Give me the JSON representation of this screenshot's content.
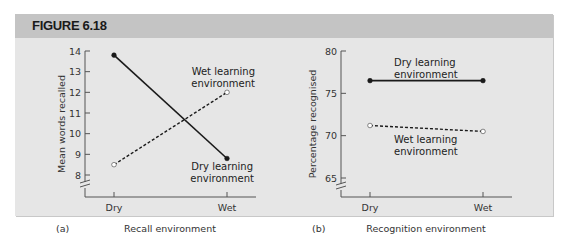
{
  "figure": {
    "title": "FIGURE 6.18"
  },
  "chart_data": [
    {
      "type": "line",
      "panel_label": "(a)",
      "xlabel": "Recall environment",
      "ylabel": "Mean words recalled",
      "categories": [
        "Dry",
        "Wet"
      ],
      "y_ticks": [
        8,
        9,
        10,
        11,
        12,
        13,
        14
      ],
      "ylim": [
        7.5,
        14
      ],
      "axis_break": true,
      "series": [
        {
          "name": "Dry learning environment",
          "label_lines": [
            "Dry learning",
            "environment"
          ],
          "style": "solid",
          "marker": "filled",
          "values": [
            13.8,
            8.8
          ]
        },
        {
          "name": "Wet learning environment",
          "label_lines": [
            "Wet learning",
            "environment"
          ],
          "style": "dashed",
          "marker": "open",
          "values": [
            8.5,
            12.0
          ]
        }
      ]
    },
    {
      "type": "line",
      "panel_label": "(b)",
      "xlabel": "Recognition environment",
      "ylabel": "Percentage recognised",
      "categories": [
        "Dry",
        "Wet"
      ],
      "y_ticks": [
        65,
        70,
        75,
        80
      ],
      "ylim": [
        64,
        80
      ],
      "axis_break": true,
      "series": [
        {
          "name": "Dry learning environment",
          "label_lines": [
            "Dry learning",
            "environment"
          ],
          "style": "solid",
          "marker": "filled",
          "values": [
            76.5,
            76.5
          ]
        },
        {
          "name": "Wet learning environment",
          "label_lines": [
            "Wet learning",
            "environment"
          ],
          "style": "dashed",
          "marker": "open",
          "values": [
            71.2,
            70.5
          ]
        }
      ]
    }
  ],
  "colors": {
    "panel_bg": "#e6e6e6",
    "header_bg": "#c4c4c4",
    "line": "#1a1a1a",
    "axis": "#555555"
  }
}
